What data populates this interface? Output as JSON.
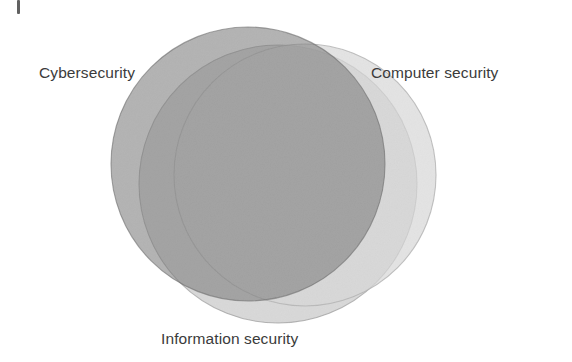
{
  "figure": {
    "type": "venn-diagram",
    "background_color": "#ffffff",
    "label_color": "#3b3b3b",
    "artifact": {
      "name": "page-edge-tick",
      "color": "#4b4b4b"
    }
  },
  "chart_data": {
    "type": "venn",
    "title": "",
    "sets": [
      {
        "id": "cybersecurity",
        "label": "Cybersecurity",
        "fill": "#7e7e7e",
        "stroke": "#6e6e6e",
        "opacity": 0.55,
        "cx": 248,
        "cy": 164,
        "r": 137,
        "label_position": "upper-left"
      },
      {
        "id": "computer-security",
        "label": "Computer security",
        "fill": "#d9d9d9",
        "stroke": "#b4b4b4",
        "opacity": 0.6,
        "cx": 305,
        "cy": 175,
        "r": 131,
        "label_position": "upper-right"
      },
      {
        "id": "information-security",
        "label": "Information security",
        "fill": "#c2c2c2",
        "stroke": "#a0a0a0",
        "opacity": 0.55,
        "cx": 278,
        "cy": 184,
        "r": 139,
        "label_position": "bottom-center"
      }
    ],
    "legend": "none",
    "grid": false,
    "annotations": []
  },
  "labels": {
    "cybersecurity": "Cybersecurity",
    "computer_security": "Computer security",
    "information_security": "Information security"
  }
}
